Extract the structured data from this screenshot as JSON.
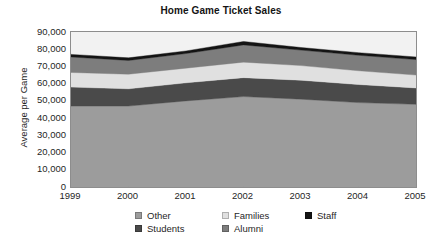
{
  "chart_data": {
    "type": "area",
    "title": "Home Game Ticket Sales",
    "xlabel": "",
    "ylabel": "Average per Game",
    "categories": [
      "1999",
      "2000",
      "2001",
      "2002",
      "2003",
      "2004",
      "2005"
    ],
    "x_tick_labels": [
      "1999",
      "2000",
      "2001",
      "2002",
      "2003",
      "2004",
      "2005"
    ],
    "y_tick_labels": [
      "90,000",
      "80,000",
      "70,000",
      "60,000",
      "50,000",
      "40,000",
      "30,000",
      "20,000",
      "10,000",
      "0"
    ],
    "ylim": [
      0,
      90000
    ],
    "ytick_values": [
      90000,
      80000,
      70000,
      60000,
      50000,
      40000,
      30000,
      20000,
      10000,
      0
    ],
    "grid": false,
    "stacked": true,
    "legend_position": "bottom",
    "legend_entries": [
      "Other",
      "Families",
      "Staff",
      "Students",
      "Alumni"
    ],
    "series": [
      {
        "name": "Other",
        "color": "#9c9c9c",
        "values": [
          47000,
          47000,
          50000,
          52500,
          51000,
          49000,
          48000
        ]
      },
      {
        "name": "Students",
        "color": "#4a4a4a",
        "values": [
          11000,
          10000,
          10500,
          11000,
          11000,
          10500,
          9500
        ]
      },
      {
        "name": "Families",
        "color": "#e0e0e0",
        "values": [
          8500,
          8500,
          8500,
          9000,
          8500,
          8000,
          7500
        ]
      },
      {
        "name": "Alumni",
        "color": "#7d7d7d",
        "values": [
          9000,
          8000,
          8500,
          10000,
          9000,
          9000,
          9000
        ]
      },
      {
        "name": "Staff",
        "color": "#141414",
        "values": [
          1500,
          1500,
          1500,
          2000,
          1500,
          1500,
          1500
        ]
      }
    ],
    "totals": [
      77000,
      75000,
      79000,
      84500,
      81000,
      78000,
      75500
    ],
    "plot_bg_color": "#f2f2f2",
    "plot_border_color": "#8d8d8d"
  }
}
